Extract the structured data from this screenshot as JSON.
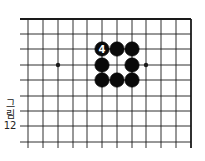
{
  "figure": {
    "caption_lines": [
      "그",
      "림",
      "12"
    ],
    "caption": "그림 12"
  },
  "board": {
    "line_color": "#1a1a1a",
    "stone_color": "#0a0a0a",
    "label_color": "#ffffff",
    "v_lines": [
      28,
      43,
      58,
      73,
      87,
      102,
      117,
      132,
      146,
      161,
      176,
      191
    ],
    "h_lines": [
      19,
      34,
      49,
      65,
      80,
      96,
      111,
      126,
      142
    ],
    "edges": {
      "top": true,
      "right": true,
      "left": false,
      "bottom": false
    },
    "star_points": [
      {
        "col": 2,
        "row": 3
      },
      {
        "col": 8,
        "row": 3
      }
    ],
    "stones": [
      {
        "col": 5,
        "row": 2,
        "color": "black",
        "label": "4"
      },
      {
        "col": 6,
        "row": 2,
        "color": "black",
        "label": ""
      },
      {
        "col": 7,
        "row": 2,
        "color": "black",
        "label": ""
      },
      {
        "col": 5,
        "row": 3,
        "color": "black",
        "label": ""
      },
      {
        "col": 7,
        "row": 3,
        "color": "black",
        "label": ""
      },
      {
        "col": 5,
        "row": 4,
        "color": "black",
        "label": ""
      },
      {
        "col": 6,
        "row": 4,
        "color": "black",
        "label": ""
      },
      {
        "col": 7,
        "row": 4,
        "color": "black",
        "label": ""
      }
    ]
  }
}
